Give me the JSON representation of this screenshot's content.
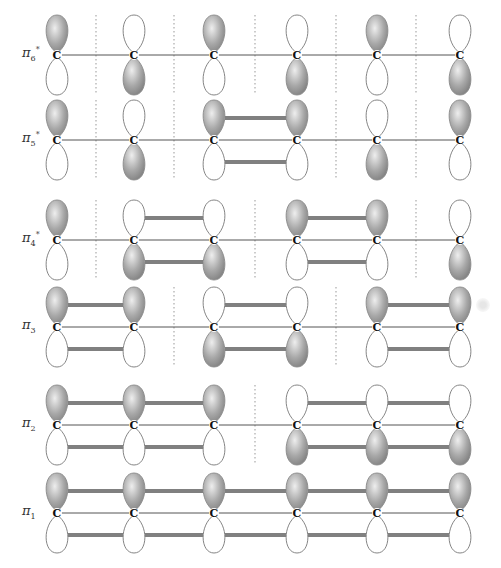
{
  "diagram": {
    "atom_label": "C",
    "atom_x": [
      57,
      134,
      214,
      297,
      377,
      460
    ],
    "colors": {
      "shaded_lobe": "#9a9a9a",
      "shaded_lobe_light": "#e8e8e8",
      "empty_lobe_stroke": "#777777",
      "bond_line": "#555555",
      "overlap_bar": "#808080",
      "node_line": "#aaaaaa"
    },
    "orbitals": [
      {
        "name": "pi6*",
        "label": "π",
        "sub": "6",
        "sup": "*",
        "y": 55,
        "phases": [
          "+",
          "-",
          "+",
          "-",
          "+",
          "-"
        ],
        "nodes_x": [
          96,
          174,
          255,
          336,
          416
        ],
        "overlaps": []
      },
      {
        "name": "pi5*",
        "label": "π",
        "sub": "5",
        "sup": "*",
        "y": 140,
        "phases": [
          "+",
          "-",
          "+",
          "+",
          "-",
          "+"
        ],
        "nodes_x": [
          96,
          174,
          336,
          416
        ],
        "overlaps": [
          [
            2,
            3
          ]
        ]
      },
      {
        "name": "pi4*",
        "label": "π",
        "sub": "4",
        "sup": "*",
        "y": 240,
        "phases": [
          "+",
          "-",
          "-",
          "+",
          "+",
          "-"
        ],
        "nodes_x": [
          96,
          255,
          416
        ],
        "overlaps": [
          [
            1,
            2
          ],
          [
            3,
            4
          ]
        ]
      },
      {
        "name": "pi3",
        "label": "π",
        "sub": "3",
        "sup": "",
        "y": 327,
        "phases": [
          "+",
          "+",
          "-",
          "-",
          "+",
          "+"
        ],
        "nodes_x": [
          174,
          336
        ],
        "overlaps": [
          [
            0,
            1
          ],
          [
            2,
            3
          ],
          [
            4,
            5
          ]
        ]
      },
      {
        "name": "pi2",
        "label": "π",
        "sub": "2",
        "sup": "",
        "y": 425,
        "phases": [
          "+",
          "+",
          "+",
          "-",
          "-",
          "-"
        ],
        "nodes_x": [
          255
        ],
        "overlaps": [
          [
            0,
            1
          ],
          [
            1,
            2
          ],
          [
            3,
            4
          ],
          [
            4,
            5
          ]
        ]
      },
      {
        "name": "pi1",
        "label": "π",
        "sub": "1",
        "sup": "",
        "y": 513,
        "phases": [
          "+",
          "+",
          "+",
          "+",
          "+",
          "+"
        ],
        "nodes_x": [],
        "overlaps": [
          [
            0,
            1
          ],
          [
            1,
            2
          ],
          [
            2,
            3
          ],
          [
            3,
            4
          ],
          [
            4,
            5
          ]
        ]
      }
    ]
  }
}
